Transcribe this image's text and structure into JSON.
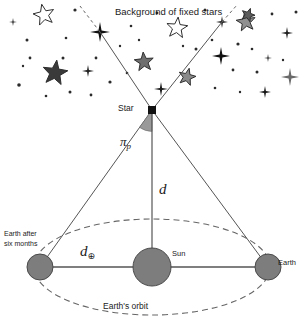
{
  "diagram": {
    "labels": {
      "background": "Background of fixed stars",
      "star": "Star",
      "sun": "Sun",
      "earth": "Earth",
      "earth_six_months_line1": "Earth after",
      "earth_six_months_line2": "six months",
      "orbit": "Earth's orbit",
      "distance_d": "d",
      "baseline_symbol": "d",
      "baseline_subscript": "⊕",
      "parallax_symbol": "π",
      "parallax_subscript": "p"
    },
    "colors": {
      "ink": "#1b1b1b",
      "line": "#555555",
      "body_fill": "#7d7d7d",
      "body_stroke": "#4a4a4a",
      "wedge_fill": "#9a9a9a",
      "dashed": "#666666",
      "background": "#ffffff"
    },
    "geometry": {
      "star_apex": [
        152,
        110
      ],
      "sun_center": [
        152,
        267
      ],
      "sun_radius": 19,
      "earth_right_center": [
        268,
        267
      ],
      "earth_left_center": [
        40,
        267
      ],
      "earth_radius": 13,
      "orbit_rx": 118,
      "orbit_ry": 48,
      "sightline_left_end": [
        100,
        32
      ],
      "sightline_right_end": [
        222,
        22
      ]
    }
  },
  "starfield": {
    "note": "background of fixed stars",
    "five_point": [
      {
        "x": 44,
        "y": 15,
        "r": 11,
        "fill": "none",
        "rot": -12
      },
      {
        "x": 55,
        "y": 73,
        "r": 13,
        "fill": "#3a3a3a",
        "rot": 8
      },
      {
        "x": 144,
        "y": 62,
        "r": 10,
        "fill": "#6f6f6f",
        "rot": -5
      },
      {
        "x": 177,
        "y": 28,
        "r": 11,
        "fill": "none",
        "rot": 6
      },
      {
        "x": 187,
        "y": 77,
        "r": 9,
        "fill": "#8a8a8a",
        "rot": 14
      },
      {
        "x": 246,
        "y": 22,
        "r": 10,
        "fill": "#909090",
        "rot": -8
      },
      {
        "x": 248,
        "y": 15,
        "r": 7,
        "fill": "#5c5c5c",
        "rot": 20
      }
    ],
    "four_point": [
      {
        "x": 100,
        "y": 32,
        "r": 10,
        "fill": "#111111"
      },
      {
        "x": 222,
        "y": 22,
        "r": 6,
        "fill": "#2a2a2a"
      },
      {
        "x": 161,
        "y": 89,
        "r": 7,
        "fill": "#1a1a1a"
      },
      {
        "x": 221,
        "y": 56,
        "r": 9,
        "fill": "#111111"
      },
      {
        "x": 290,
        "y": 77,
        "r": 9,
        "fill": "#6a6a6a"
      },
      {
        "x": 287,
        "y": 33,
        "r": 6,
        "fill": "#1f1f1f"
      },
      {
        "x": 265,
        "y": 92,
        "r": 6,
        "fill": "#161616"
      },
      {
        "x": 88,
        "y": 71,
        "r": 6,
        "fill": "#222222"
      },
      {
        "x": 13,
        "y": 22,
        "r": 4,
        "fill": "#2a2a2a"
      },
      {
        "x": 268,
        "y": 58,
        "r": 4,
        "fill": "#2f2f2f"
      }
    ],
    "dots": [
      {
        "x": 75,
        "y": 10,
        "r": 1.6
      },
      {
        "x": 27,
        "y": 40,
        "r": 1.5
      },
      {
        "x": 30,
        "y": 58,
        "r": 1.4
      },
      {
        "x": 19,
        "y": 85,
        "r": 1.8
      },
      {
        "x": 66,
        "y": 38,
        "r": 1.3
      },
      {
        "x": 63,
        "y": 58,
        "r": 1.5
      },
      {
        "x": 96,
        "y": 58,
        "r": 1.4
      },
      {
        "x": 110,
        "y": 82,
        "r": 1.6
      },
      {
        "x": 120,
        "y": 46,
        "r": 1.2
      },
      {
        "x": 131,
        "y": 26,
        "r": 1.3
      },
      {
        "x": 139,
        "y": 40,
        "r": 1.2
      },
      {
        "x": 157,
        "y": 13,
        "r": 1.4
      },
      {
        "x": 196,
        "y": 49,
        "r": 1.5
      },
      {
        "x": 205,
        "y": 10,
        "r": 1.5
      },
      {
        "x": 212,
        "y": 40,
        "r": 1.3
      },
      {
        "x": 233,
        "y": 70,
        "r": 1.4
      },
      {
        "x": 238,
        "y": 44,
        "r": 1.6
      },
      {
        "x": 252,
        "y": 49,
        "r": 1.3
      },
      {
        "x": 257,
        "y": 72,
        "r": 1.5
      },
      {
        "x": 272,
        "y": 14,
        "r": 1.4
      },
      {
        "x": 296,
        "y": 12,
        "r": 1.5
      },
      {
        "x": 215,
        "y": 88,
        "r": 1.3
      },
      {
        "x": 240,
        "y": 92,
        "r": 1.2
      },
      {
        "x": 183,
        "y": 46,
        "r": 1.2
      },
      {
        "x": 91,
        "y": 95,
        "r": 1.4
      },
      {
        "x": 70,
        "y": 92,
        "r": 1.5
      },
      {
        "x": 46,
        "y": 96,
        "r": 1.3
      },
      {
        "x": 23,
        "y": 66,
        "r": 1.2
      },
      {
        "x": 283,
        "y": 60,
        "r": 1.2
      },
      {
        "x": 127,
        "y": 73,
        "r": 1.3
      }
    ]
  }
}
